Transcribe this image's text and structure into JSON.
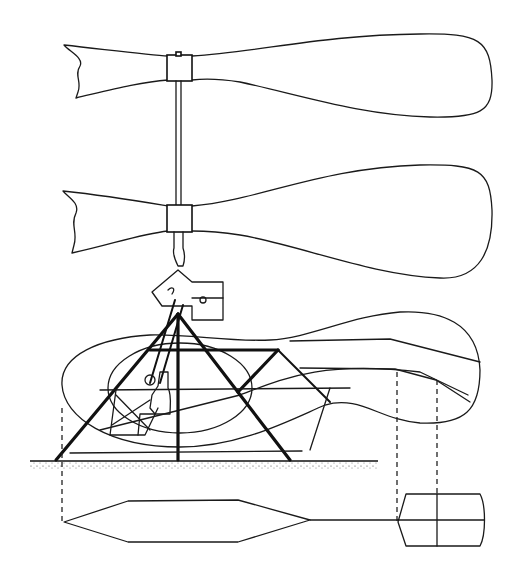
{
  "figure": {
    "type": "technical-line-drawing",
    "components": [
      {
        "id": "upper-rotor-blade",
        "label": "upper rotor blade"
      },
      {
        "id": "lower-rotor-blade",
        "label": "lower rotor blade"
      },
      {
        "id": "rotor-mast",
        "label": "rotor mast"
      },
      {
        "id": "engine-gearbox",
        "label": "engine / gearbox housing"
      },
      {
        "id": "tripod-frame",
        "label": "tripod support frame"
      },
      {
        "id": "pilot-figure",
        "label": "seated pilot"
      },
      {
        "id": "ground-line",
        "label": "ground"
      },
      {
        "id": "plan-view-hull",
        "label": "plan view hull"
      },
      {
        "id": "plan-view-tail",
        "label": "plan view tail box"
      }
    ],
    "colors": {
      "ink": "#111111",
      "paper": "#ffffff"
    }
  }
}
